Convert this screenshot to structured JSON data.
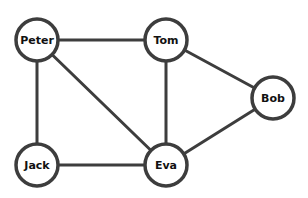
{
  "graph": {
    "type": "undirected",
    "node_radius": 21,
    "colors": {
      "stroke": "#3d3d3d",
      "node_fill": "#ffffff",
      "label": "#111111",
      "background": "#ffffff"
    },
    "nodes": [
      {
        "id": "peter",
        "label": "Peter",
        "x": 37,
        "y": 40
      },
      {
        "id": "tom",
        "label": "Tom",
        "x": 166,
        "y": 40
      },
      {
        "id": "bob",
        "label": "Bob",
        "x": 273,
        "y": 98
      },
      {
        "id": "jack",
        "label": "Jack",
        "x": 37,
        "y": 165
      },
      {
        "id": "eva",
        "label": "Eva",
        "x": 166,
        "y": 165
      }
    ],
    "edges": [
      {
        "from": "peter",
        "to": "tom"
      },
      {
        "from": "peter",
        "to": "jack"
      },
      {
        "from": "peter",
        "to": "eva"
      },
      {
        "from": "tom",
        "to": "eva"
      },
      {
        "from": "tom",
        "to": "bob"
      },
      {
        "from": "jack",
        "to": "eva"
      },
      {
        "from": "eva",
        "to": "bob"
      }
    ]
  }
}
